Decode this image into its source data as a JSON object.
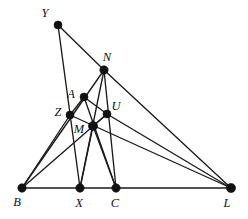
{
  "figure": {
    "background_color": "#ffffff",
    "line_color": "#1a1a1a",
    "point_color": "#111111",
    "width": 248,
    "height": 219,
    "points": [
      {
        "id": "Y",
        "label": "Y",
        "x": 58,
        "y": 25,
        "r": 4.0,
        "label_x": 45,
        "label_y": 14
      },
      {
        "id": "N",
        "label": "N",
        "x": 104,
        "y": 70,
        "r": 4.2,
        "label_x": 107,
        "label_y": 58
      },
      {
        "id": "A",
        "label": "A",
        "x": 84,
        "y": 97,
        "r": 4.0,
        "label_x": 71,
        "label_y": 95
      },
      {
        "id": "U",
        "label": "U",
        "x": 107,
        "y": 114,
        "r": 4.0,
        "label_x": 116,
        "label_y": 107
      },
      {
        "id": "Z",
        "label": "Z",
        "x": 70,
        "y": 115,
        "r": 4.0,
        "label_x": 58,
        "label_y": 113
      },
      {
        "id": "M",
        "label": "M",
        "x": 93,
        "y": 126,
        "r": 4.6,
        "label_x": 79,
        "label_y": 130
      },
      {
        "id": "B",
        "label": "B",
        "x": 22,
        "y": 188,
        "r": 4.2,
        "label_x": 17,
        "label_y": 203
      },
      {
        "id": "X",
        "label": "X",
        "x": 80,
        "y": 188,
        "r": 4.2,
        "label_x": 79,
        "label_y": 204
      },
      {
        "id": "C",
        "label": "C",
        "x": 116,
        "y": 188,
        "r": 4.2,
        "label_x": 115,
        "label_y": 204
      },
      {
        "id": "L",
        "label": "L",
        "x": 231,
        "y": 188,
        "r": 4.6,
        "label_x": 227,
        "label_y": 204
      }
    ],
    "segments": [
      {
        "id": "seg-B-L",
        "from": "B",
        "to": "L",
        "name": "baseline-B-L"
      },
      {
        "id": "seg-Y-N",
        "from": "Y",
        "to": "N",
        "name": "segment-Y-N"
      },
      {
        "id": "seg-Y-X",
        "from": "Y",
        "to": "X",
        "name": "segment-Y-X"
      },
      {
        "id": "seg-N-B",
        "from": "N",
        "to": "B",
        "name": "segment-N-B"
      },
      {
        "id": "seg-N-X",
        "from": "N",
        "to": "X",
        "name": "segment-N-X"
      },
      {
        "id": "seg-N-C",
        "from": "N",
        "to": "C",
        "name": "segment-N-C"
      },
      {
        "id": "seg-N-L",
        "from": "N",
        "to": "L",
        "name": "segment-N-L"
      },
      {
        "id": "seg-A-U",
        "from": "A",
        "to": "U",
        "name": "segment-A-U"
      },
      {
        "id": "seg-A-C",
        "from": "A",
        "to": "C",
        "name": "segment-A-C"
      },
      {
        "id": "seg-A-Z",
        "from": "A",
        "to": "Z",
        "name": "segment-A-Z"
      },
      {
        "id": "seg-Z-B",
        "from": "Z",
        "to": "B",
        "name": "segment-Z-B"
      },
      {
        "id": "seg-Z-L",
        "from": "Z",
        "to": "L",
        "name": "segment-Z-L"
      },
      {
        "id": "seg-M-X",
        "from": "M",
        "to": "X",
        "name": "segment-M-X"
      },
      {
        "id": "seg-M-C",
        "from": "M",
        "to": "C",
        "name": "segment-M-C"
      },
      {
        "id": "seg-M-U",
        "from": "M",
        "to": "U",
        "name": "segment-M-U"
      },
      {
        "id": "seg-U-L",
        "from": "U",
        "to": "L",
        "name": "segment-U-L"
      },
      {
        "id": "seg-B-U",
        "from": "B",
        "to": "U",
        "name": "segment-B-U"
      }
    ]
  }
}
